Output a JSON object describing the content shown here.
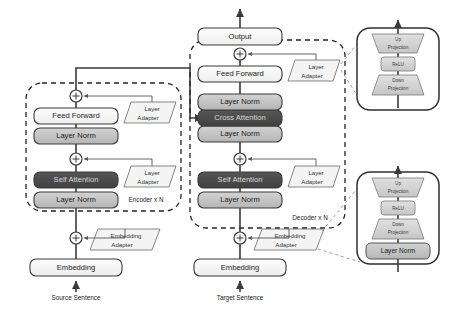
{
  "figure": {
    "colors": {
      "attention_fill": "#4a4a4a",
      "attention_text": "#d8d8d8",
      "layernorm_fill": "#c3c3c3",
      "plain_fill": "#ffffff",
      "adapter_fill": "#f2f2f2",
      "detail_fill": "#d5d5d5",
      "line": "#3a3a3a"
    }
  },
  "encoder": {
    "group_label": "Encoder x N",
    "input_label": "Source Sentence",
    "blocks": {
      "embedding": "Embedding",
      "layer_norm_lower": "Layer Norm",
      "self_attention": "Self Attention",
      "layer_norm_upper": "Layer Norm",
      "feed_forward": "Feed Forward"
    },
    "adapters": {
      "embedding_adapter_line1": "Embedding",
      "embedding_adapter_line2": "Adapter",
      "layer_adapter_lower_line1": "Layer",
      "layer_adapter_lower_line2": "Adapter",
      "layer_adapter_upper_line1": "Layer",
      "layer_adapter_upper_line2": "Adapter"
    },
    "residual_symbol": "+"
  },
  "decoder": {
    "group_label": "Decoder x N",
    "input_label": "Target Sentence",
    "output_label": "Output",
    "blocks": {
      "embedding": "Embedding",
      "layer_norm_lower": "Layer Norm",
      "self_attention": "Self Attention",
      "layer_norm_mid": "Layer Norm",
      "cross_attention": "Cross Attention",
      "layer_norm_upper": "Layer Norm",
      "feed_forward": "Feed Forward"
    },
    "adapters": {
      "embedding_adapter_line1": "Embedding",
      "embedding_adapter_line2": "Adapter",
      "layer_adapter_lower_line1": "Layer",
      "layer_adapter_lower_line2": "Adapter",
      "layer_adapter_upper_line1": "Layer",
      "layer_adapter_upper_line2": "Adapter"
    },
    "residual_symbol": "+"
  },
  "detail_layer_adapter": {
    "up_projection_line1": "Up",
    "up_projection_line2": "Projection",
    "relu": "ReLU",
    "down_projection_line1": "Down",
    "down_projection_line2": "Projection"
  },
  "detail_embedding_adapter": {
    "up_projection_line1": "Up",
    "up_projection_line2": "Projection",
    "relu": "ReLU",
    "down_projection_line1": "Down",
    "down_projection_line2": "Projection",
    "layer_norm": "Layer Norm"
  }
}
